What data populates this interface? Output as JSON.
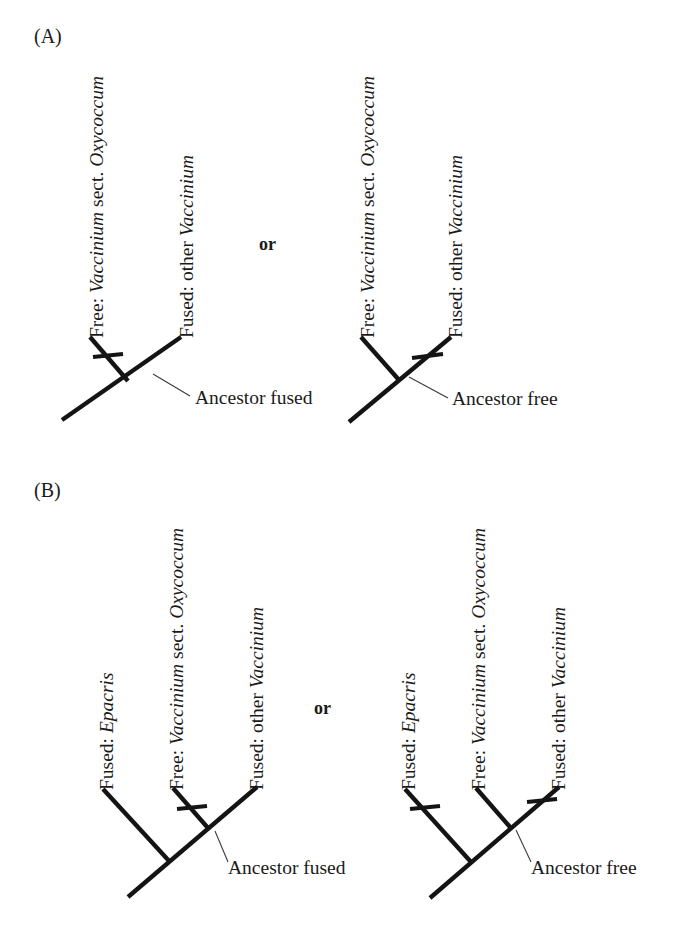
{
  "figure": {
    "background_color": "#ffffff",
    "line_color": "#141414",
    "text_color": "#1a1a1a",
    "leader_color": "#3a3a3a"
  },
  "panels": [
    {
      "id": "panel-a",
      "letter": "(A)",
      "conjunction": "or",
      "trees": [
        {
          "id": "panel-a-left-tree",
          "ancestor_label": "Ancestor fused",
          "tips": [
            {
              "id": "tip-free-oxycoccum",
              "state": "Free: ",
              "taxon": "Vaccinium",
              "qualifier": " sect. ",
              "taxon2": "Oxycoccum",
              "full": "Free: Vaccinium sect. Oxycoccum",
              "has_change_tick": true
            },
            {
              "id": "tip-fused-other-vaccinium",
              "state": "Fused: other ",
              "taxon": "Vaccinium",
              "qualifier": "",
              "taxon2": "",
              "full": "Fused: other Vaccinium",
              "has_change_tick": false
            }
          ]
        },
        {
          "id": "panel-a-right-tree",
          "ancestor_label": "Ancestor free",
          "tips": [
            {
              "id": "tip-free-oxycoccum",
              "state": "Free: ",
              "taxon": "Vaccinium",
              "qualifier": " sect. ",
              "taxon2": "Oxycoccum",
              "full": "Free: Vaccinium sect. Oxycoccum",
              "has_change_tick": false
            },
            {
              "id": "tip-fused-other-vaccinium",
              "state": "Fused: other ",
              "taxon": "Vaccinium",
              "qualifier": "",
              "taxon2": "",
              "full": "Fused: other Vaccinium",
              "has_change_tick": true
            }
          ]
        }
      ]
    },
    {
      "id": "panel-b",
      "letter": "(B)",
      "conjunction": "or",
      "trees": [
        {
          "id": "panel-b-left-tree",
          "ancestor_label": "Ancestor fused",
          "tips": [
            {
              "id": "tip-fused-epacris",
              "state": "Fused: ",
              "taxon": "Epacris",
              "qualifier": "",
              "taxon2": "",
              "full": "Fused: Epacris",
              "has_change_tick": false
            },
            {
              "id": "tip-free-oxycoccum",
              "state": "Free: ",
              "taxon": "Vaccinium",
              "qualifier": " sect. ",
              "taxon2": "Oxycoccum",
              "full": "Free: Vaccinium sect. Oxycoccum",
              "has_change_tick": true
            },
            {
              "id": "tip-fused-other-vaccinium",
              "state": "Fused: other ",
              "taxon": "Vaccinium",
              "qualifier": "",
              "taxon2": "",
              "full": "Fused: other Vaccinium",
              "has_change_tick": false
            }
          ]
        },
        {
          "id": "panel-b-right-tree",
          "ancestor_label": "Ancestor free",
          "tips": [
            {
              "id": "tip-fused-epacris",
              "state": "Fused: ",
              "taxon": "Epacris",
              "qualifier": "",
              "taxon2": "",
              "full": "Fused: Epacris",
              "has_change_tick": true
            },
            {
              "id": "tip-free-oxycoccum",
              "state": "Free: ",
              "taxon": "Vaccinium",
              "qualifier": " sect. ",
              "taxon2": "Oxycoccum",
              "full": "Free: Vaccinium sect. Oxycoccum",
              "has_change_tick": false
            },
            {
              "id": "tip-fused-other-vaccinium",
              "state": "Fused: other ",
              "taxon": "Vaccinium",
              "qualifier": "",
              "taxon2": "",
              "full": "Fused: other Vaccinium",
              "has_change_tick": true
            }
          ]
        }
      ]
    }
  ],
  "labels": {
    "panel_a_letter": "(A)",
    "panel_b_letter": "(B)",
    "or_a": "or",
    "or_b": "or",
    "a_left_free_state": "Free: ",
    "a_left_free_taxon": "Vaccinium",
    "a_left_free_sect": " sect. ",
    "a_left_free_taxon2": "Oxycoccum",
    "a_left_fused_state": "Fused: other ",
    "a_left_fused_taxon": "Vaccinium",
    "a_left_ancestor": "Ancestor fused",
    "a_right_free_state": "Free: ",
    "a_right_free_taxon": "Vaccinium",
    "a_right_free_sect": " sect. ",
    "a_right_free_taxon2": "Oxycoccum",
    "a_right_fused_state": "Fused: other ",
    "a_right_fused_taxon": "Vaccinium",
    "a_right_ancestor": "Ancestor free",
    "b_left_epacris_state": "Fused: ",
    "b_left_epacris_taxon": "Epacris",
    "b_left_free_state": "Free: ",
    "b_left_free_taxon": "Vaccinium",
    "b_left_free_sect": " sect. ",
    "b_left_free_taxon2": "Oxycoccum",
    "b_left_fused_state": "Fused: other ",
    "b_left_fused_taxon": "Vaccinium",
    "b_left_ancestor": "Ancestor fused",
    "b_right_epacris_state": "Fused: ",
    "b_right_epacris_taxon": "Epacris",
    "b_right_free_state": "Free: ",
    "b_right_free_taxon": "Vaccinium",
    "b_right_free_sect": " sect. ",
    "b_right_free_taxon2": "Oxycoccum",
    "b_right_fused_state": "Fused: other ",
    "b_right_fused_taxon": "Vaccinium",
    "b_right_ancestor": "Ancestor free"
  }
}
